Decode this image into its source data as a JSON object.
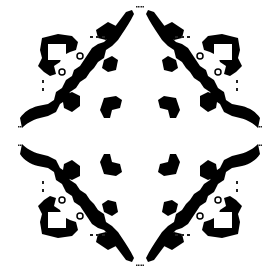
{
  "diagram": {
    "type": "architectural-floor-plan",
    "center": [
      140,
      136
    ],
    "colors": {
      "wall": "#000000",
      "background": "#ffffff",
      "dot": "#222222"
    },
    "quadrants": [
      "top-left",
      "top-right",
      "bottom-left",
      "bottom-right"
    ]
  }
}
